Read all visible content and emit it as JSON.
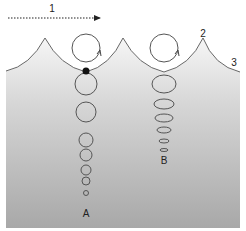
{
  "diagram": {
    "type": "ocean-wave-orbital-motion",
    "labels": {
      "propagation_direction": "1",
      "wave_crest": "2",
      "water_surface": "3",
      "deep_water_column": "A",
      "shallow_water_column": "B"
    },
    "colors": {
      "water_top": "#f4f4f4",
      "water_bottom": "#a9a9a9",
      "stroke": "#555555",
      "particle_dot": "#111111",
      "arrow": "#222222"
    },
    "column_a": {
      "x": 86,
      "top_orbit": {
        "cy": 48,
        "r": 14
      },
      "orbits": [
        {
          "cy": 84,
          "r": 11
        },
        {
          "cy": 112,
          "r": 10
        },
        {
          "cy": 140,
          "r": 7
        },
        {
          "cy": 155,
          "r": 6
        },
        {
          "cy": 170,
          "r": 5
        },
        {
          "cy": 181,
          "r": 4
        },
        {
          "cy": 193,
          "r": 2.5
        }
      ]
    },
    "column_b": {
      "x": 164,
      "top_orbit": {
        "cy": 48,
        "r": 14
      },
      "orbits": [
        {
          "cy": 84,
          "rx": 12,
          "ry": 9
        },
        {
          "cy": 104,
          "rx": 10,
          "ry": 5
        },
        {
          "cy": 118,
          "rx": 9,
          "ry": 4
        },
        {
          "cy": 130,
          "rx": 7,
          "ry": 3
        },
        {
          "cy": 141,
          "rx": 5,
          "ry": 2
        },
        {
          "cy": 150,
          "rx": 4,
          "ry": 1.5
        }
      ]
    }
  }
}
